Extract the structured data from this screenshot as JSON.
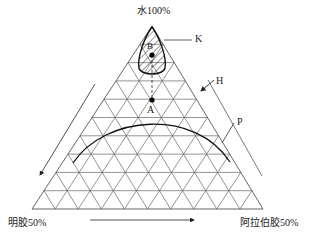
{
  "labels": {
    "top": "水100%",
    "bottom_left": "明胶50%",
    "bottom_right": "阿拉伯胶50%",
    "K": "K",
    "H": "H",
    "P": "P",
    "A": "A",
    "B": "B"
  },
  "triangle": {
    "apex": [
      152,
      26
    ],
    "left": [
      32,
      209
    ],
    "right": [
      263,
      209
    ],
    "divisions": 10
  },
  "colors": {
    "grid": "#555555",
    "curve": "#111111",
    "text": "#222222"
  }
}
